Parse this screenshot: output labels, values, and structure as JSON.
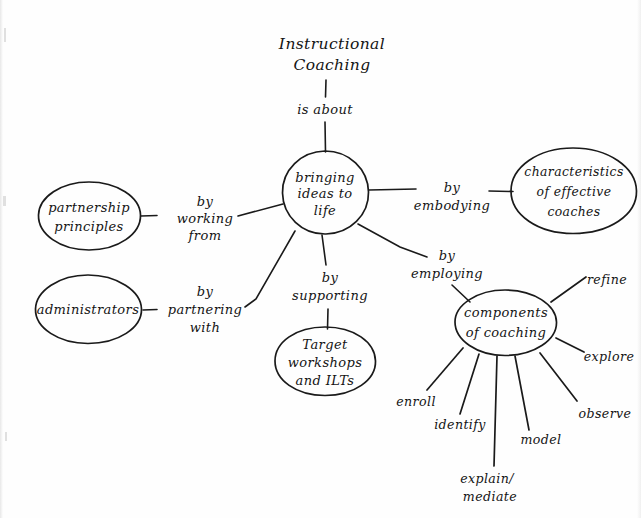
{
  "title": {
    "line1": "Instructional",
    "line2": "Coaching"
  },
  "root_link": {
    "label": "is about"
  },
  "center_node": {
    "line1": "bringing",
    "line2": "ideas to",
    "line3": "life"
  },
  "branches": [
    {
      "id": "partnership",
      "link_line1": "by",
      "link_line2": "working",
      "link_line3": "from",
      "node_line1": "partnership",
      "node_line2": "principles"
    },
    {
      "id": "administrators",
      "link_line1": "by",
      "link_line2": "partnering",
      "link_line3": "with",
      "node_line1": "administrators",
      "node_line2": ""
    },
    {
      "id": "characteristics",
      "link_line1": "by",
      "link_line2": "embodying",
      "link_line3": "",
      "node_line1": "characteristics",
      "node_line2": "of effective",
      "node_line3": "coaches"
    },
    {
      "id": "target-workshops",
      "link_line1": "by",
      "link_line2": "supporting",
      "link_line3": "",
      "node_line1": "Target",
      "node_line2": "workshops",
      "node_line3": "and ILTs"
    },
    {
      "id": "components",
      "link_line1": "by",
      "link_line2": "employing",
      "link_line3": "",
      "node_line1": "components",
      "node_line2": "of coaching"
    }
  ],
  "components_spokes": [
    {
      "id": "refine",
      "label": "refine"
    },
    {
      "id": "explore",
      "label": "explore"
    },
    {
      "id": "observe",
      "label": "observe"
    },
    {
      "id": "model",
      "label": "model"
    },
    {
      "id": "explain-mediate-1",
      "label": "explain/"
    },
    {
      "id": "explain-mediate-2",
      "label": "mediate"
    },
    {
      "id": "identify",
      "label": "identify"
    },
    {
      "id": "enroll",
      "label": "enroll"
    }
  ],
  "colors": {
    "ink": "#1a1a1a",
    "paper": "#fefefe"
  }
}
